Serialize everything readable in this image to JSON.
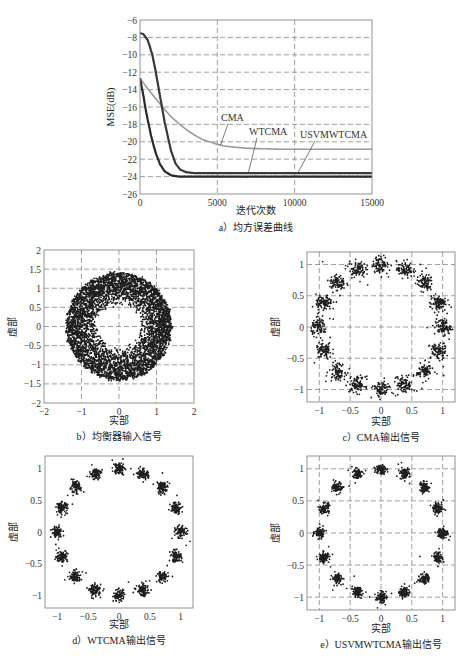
{
  "chart_data": [
    {
      "id": "a",
      "type": "line",
      "caption": "a）均方误差曲线",
      "xlabel": "迭代次数",
      "ylabel": "MSE(dB)",
      "xlim": [
        0,
        15000
      ],
      "ylim": [
        -26,
        -6
      ],
      "xticks": [
        0,
        5000,
        10000,
        15000
      ],
      "xtick_labels": [
        "0",
        "5000",
        "10000",
        "15000"
      ],
      "yticks": [
        -6,
        -8,
        -10,
        -12,
        -14,
        -16,
        -18,
        -20,
        -22,
        -24,
        -26
      ],
      "ytick_labels": [
        "−6",
        "−8",
        "−10",
        "−12",
        "−14",
        "−16",
        "−18",
        "−20",
        "−22",
        "−24",
        "−26"
      ],
      "grid": true,
      "series": [
        {
          "name": "CMA",
          "color": "#9a9a9a",
          "x": [
            0,
            500,
            1000,
            1500,
            2000,
            2500,
            3000,
            3500,
            4000,
            4500,
            5000,
            5500,
            6000,
            7000,
            8000,
            9000,
            10000,
            12000,
            15000
          ],
          "y": [
            -12.7,
            -13.9,
            -15.0,
            -16.1,
            -17.1,
            -17.9,
            -18.6,
            -19.2,
            -19.7,
            -20.0,
            -20.3,
            -20.5,
            -20.6,
            -20.75,
            -20.8,
            -20.85,
            -20.85,
            -20.85,
            -20.85
          ]
        },
        {
          "name": "WTCMA",
          "color": "#3a3a3a",
          "x": [
            0,
            200,
            500,
            800,
            1000,
            1300,
            1600,
            2000,
            2300,
            2600,
            3000,
            3500,
            4000,
            5000,
            8000,
            12000,
            15000
          ],
          "y": [
            -7.5,
            -7.6,
            -8.3,
            -10.0,
            -11.8,
            -14.8,
            -17.8,
            -21.0,
            -22.5,
            -23.2,
            -23.5,
            -23.6,
            -23.6,
            -23.6,
            -23.6,
            -23.6,
            -23.6
          ]
        },
        {
          "name": "USVMWTCMA",
          "color": "#2a2a2a",
          "x": [
            0,
            200,
            400,
            700,
            1000,
            1300,
            1600,
            2000,
            2500,
            3000,
            5000,
            10000,
            15000
          ],
          "y": [
            -12.7,
            -14.5,
            -16.6,
            -19.2,
            -21.2,
            -22.6,
            -23.4,
            -23.85,
            -24.0,
            -24.0,
            -24.0,
            -24.0,
            -24.0
          ]
        }
      ],
      "annotations": [
        {
          "text": "CMA",
          "target_x": 5200,
          "target_y": -20.4
        },
        {
          "text": "WTCMA",
          "target_x": 7000,
          "target_y": -23.6
        },
        {
          "text": "USVMWTCMA",
          "target_x": 10200,
          "target_y": -23.6
        }
      ]
    },
    {
      "id": "b",
      "type": "scatter",
      "caption": "b）均衡器输入信号",
      "xlabel": "实部",
      "ylabel": "虚部",
      "xlim": [
        -2,
        2
      ],
      "ylim": [
        -2,
        2
      ],
      "xticks": [
        -2,
        -1,
        0,
        1,
        2
      ],
      "xtick_labels": [
        "−2",
        "−1",
        "0",
        "1",
        "2"
      ],
      "yticks": [
        2,
        1.5,
        1,
        0.5,
        0,
        -0.5,
        -1,
        -1.5,
        -2
      ],
      "ytick_labels": [
        "2",
        "1.5",
        "1",
        "0.5",
        "0",
        "−0.5",
        "−1",
        "−1.5",
        "−2"
      ],
      "grid": true,
      "distribution": {
        "shape": "annulus",
        "inner_radius": 0.55,
        "outer_radius": 1.4,
        "points": 4500
      }
    },
    {
      "id": "c",
      "type": "scatter",
      "caption": "c）CMA输出信号",
      "xlabel": "实部",
      "ylabel": "虚部",
      "xlim": [
        -1.2,
        1.2
      ],
      "ylim": [
        -1.2,
        1.2
      ],
      "xticks": [
        -1,
        -0.5,
        0,
        0.5,
        1
      ],
      "xtick_labels": [
        "−1",
        "−0.5",
        "0",
        "0.5",
        "1"
      ],
      "yticks": [
        1,
        0.5,
        0,
        -0.5,
        -1
      ],
      "ytick_labels": [
        "1",
        "0.5",
        "0",
        "−0.5",
        "−1"
      ],
      "grid": true,
      "distribution": {
        "shape": "16-point ring",
        "radius": 1.0,
        "cluster_count": 16,
        "cluster_spread": 0.065,
        "points_per_cluster": 90,
        "phase_offset_deg": 0
      }
    },
    {
      "id": "d",
      "type": "scatter",
      "caption": "d）WTCMA输出信号",
      "xlabel": "实部",
      "ylabel": "虚部",
      "xlim": [
        -1.2,
        1.2
      ],
      "ylim": [
        -1.2,
        1.2
      ],
      "xticks": [
        -1,
        -0.5,
        0,
        0.5,
        1
      ],
      "xtick_labels": [
        "−1",
        "−0.5",
        "0",
        "0.5",
        "1"
      ],
      "yticks": [
        1,
        0.5,
        0,
        -0.5,
        -1
      ],
      "ytick_labels": [
        "1",
        "0.5",
        "0",
        "−0.5",
        "−1"
      ],
      "grid": false,
      "distribution": {
        "shape": "16-point ring",
        "radius": 1.0,
        "cluster_count": 16,
        "cluster_spread": 0.045,
        "points_per_cluster": 90,
        "phase_offset_deg": 0
      }
    },
    {
      "id": "e",
      "type": "scatter",
      "caption": "e）USVMWTCMA输出信号",
      "xlabel": "实部",
      "ylabel": "虚部",
      "xlim": [
        -1.2,
        1.2
      ],
      "ylim": [
        -1.2,
        1.2
      ],
      "xticks": [
        -1,
        -0.5,
        0,
        0.5,
        1
      ],
      "xtick_labels": [
        "−1",
        "−0.5",
        "0",
        "0.5",
        "1"
      ],
      "yticks": [
        1,
        0.5,
        0,
        -0.5,
        -1
      ],
      "ytick_labels": [
        "1",
        "0.5",
        "0",
        "−0.5",
        "−1"
      ],
      "grid": true,
      "distribution": {
        "shape": "16-point ring",
        "radius": 1.0,
        "cluster_count": 16,
        "cluster_spread": 0.04,
        "points_per_cluster": 90,
        "phase_offset_deg": 0
      }
    }
  ],
  "layout": {
    "a": {
      "left": 140,
      "top": 20,
      "right": 372,
      "bottom": 194,
      "caption_y": 231,
      "xlabel_y": 214
    },
    "b": {
      "left": 44,
      "top": 250,
      "right": 194,
      "bottom": 403,
      "caption_y": 440,
      "xlabel_y": 424
    },
    "c": {
      "left": 307,
      "top": 252,
      "right": 455,
      "bottom": 402,
      "caption_y": 441,
      "xlabel_y": 425
    },
    "d": {
      "left": 45,
      "top": 456,
      "right": 193,
      "bottom": 608,
      "caption_y": 644,
      "xlabel_y": 628
    },
    "e": {
      "left": 307,
      "top": 456,
      "right": 455,
      "bottom": 610,
      "caption_y": 648,
      "xlabel_y": 632
    }
  }
}
